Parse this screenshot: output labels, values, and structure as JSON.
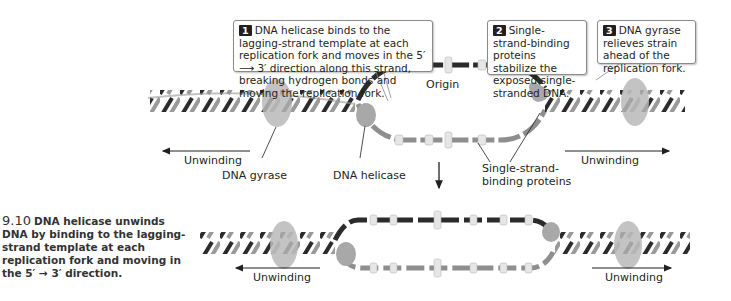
{
  "callouts": [
    {
      "number": "1",
      "text": "DNA helicase binds to the lagging-strand template at each replication fork and moves in the 5′ ⟶ 3′ direction along this strand, breaking hydrogen bonds and moving the replication fork."
    },
    {
      "number": "2",
      "text": "Single-strand-binding proteins stabilize the exposed single-stranded DNA."
    },
    {
      "number": "3",
      "text": "DNA gyrase relieves strain ahead of the replication fork."
    }
  ],
  "labels": {
    "origin": "Origin",
    "unwinding_left_top": "Unwinding",
    "unwinding_right_top": "Unwinding",
    "dna_gyrase": "DNA gyrase",
    "dna_helicase": "DNA helicase",
    "ssb_line1": "Single-strand-",
    "ssb_line2": "binding proteins",
    "unwinding_left_bottom": "Unwinding",
    "unwinding_right_bottom": "Unwinding"
  },
  "caption": {
    "figure_number": "9.10",
    "text": "DNA helicase unwinds DNA by binding to the lagging-strand template at each replication fork and moving in the 5′ → 3′ direction."
  },
  "colors": {
    "dark_strand": "#2b2b2b",
    "light_strand": "#9a9a9a",
    "protein": "#a8a8a8",
    "ssb": "#e4e4e4"
  }
}
